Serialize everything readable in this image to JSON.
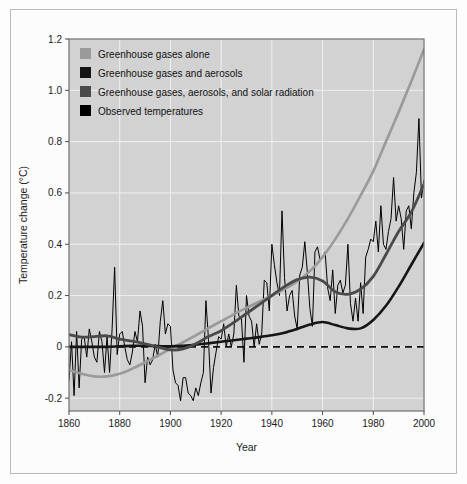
{
  "chart_data": {
    "type": "line",
    "title": "",
    "xlabel": "Year",
    "ylabel": "Temperature change (°C)",
    "xlim": [
      1860,
      2000
    ],
    "ylim": [
      -0.25,
      1.2
    ],
    "xticks": [
      1860,
      1880,
      1900,
      1920,
      1940,
      1960,
      1980,
      2000
    ],
    "xtick_labels": [
      "1860",
      "1880",
      "1900",
      "1920",
      "1940",
      "1960",
      "1980",
      "2000"
    ],
    "yticks": [
      -0.2,
      0,
      0.2,
      0.4,
      0.6,
      0.8,
      1.0,
      1.2
    ],
    "ytick_labels": [
      "-0.2",
      "0",
      "0.2",
      "0.4",
      "0.6",
      "0.8",
      "1.0",
      "1.2"
    ],
    "grid": true,
    "grid_color": "#f0f0f0",
    "plot_background": "#d2d2d2",
    "zero_reference_line": {
      "value": 0,
      "style": "dashed",
      "color": "#111111"
    },
    "legend_position": "top-left",
    "legend": [
      {
        "label": "Greenhouse gases alone",
        "color": "#9a9a9a"
      },
      {
        "label": "Greenhouse gases and aerosols",
        "color": "#151515"
      },
      {
        "label": "Greenhouse gases, aerosols, and solar radiation",
        "color": "#4a4a4a"
      },
      {
        "label": "Observed temperatures",
        "color": "#000000"
      }
    ],
    "series": [
      {
        "name": "Greenhouse gases alone",
        "color": "#9a9a9a",
        "width": 2.6,
        "x": [
          1860,
          1865,
          1870,
          1875,
          1880,
          1885,
          1890,
          1895,
          1900,
          1905,
          1910,
          1915,
          1920,
          1925,
          1930,
          1935,
          1940,
          1945,
          1950,
          1955,
          1960,
          1965,
          1970,
          1975,
          1980,
          1985,
          1990,
          1995,
          2000
        ],
        "values": [
          -0.09,
          -0.105,
          -0.115,
          -0.115,
          -0.105,
          -0.085,
          -0.06,
          -0.035,
          -0.008,
          0.018,
          0.045,
          0.073,
          0.1,
          0.127,
          0.152,
          0.176,
          0.2,
          0.225,
          0.255,
          0.295,
          0.35,
          0.42,
          0.5,
          0.59,
          0.685,
          0.8,
          0.915,
          1.035,
          1.16
        ]
      },
      {
        "name": "Greenhouse gases and aerosols",
        "color": "#151515",
        "width": 2.6,
        "x": [
          1860,
          1865,
          1870,
          1875,
          1880,
          1885,
          1890,
          1895,
          1900,
          1905,
          1910,
          1915,
          1920,
          1925,
          1930,
          1935,
          1940,
          1945,
          1950,
          1955,
          1960,
          1965,
          1970,
          1975,
          1980,
          1985,
          1990,
          1995,
          2000
        ],
        "values": [
          0.0,
          0.0,
          0.0,
          0.0,
          0.002,
          0.004,
          0.004,
          0.003,
          0.002,
          0.004,
          0.008,
          0.014,
          0.02,
          0.026,
          0.032,
          0.038,
          0.045,
          0.055,
          0.07,
          0.087,
          0.097,
          0.085,
          0.072,
          0.072,
          0.105,
          0.16,
          0.235,
          0.32,
          0.405
        ]
      },
      {
        "name": "Greenhouse gases, aerosols, and solar radiation",
        "color": "#4a4a4a",
        "width": 2.8,
        "x": [
          1860,
          1865,
          1870,
          1875,
          1880,
          1885,
          1890,
          1895,
          1900,
          1905,
          1910,
          1915,
          1920,
          1925,
          1930,
          1935,
          1940,
          1945,
          1950,
          1955,
          1960,
          1965,
          1970,
          1975,
          1980,
          1985,
          1990,
          1995,
          2000
        ],
        "values": [
          0.048,
          0.038,
          0.04,
          0.043,
          0.03,
          0.022,
          0.012,
          0.0,
          -0.012,
          -0.008,
          0.012,
          0.04,
          0.063,
          0.095,
          0.13,
          0.165,
          0.2,
          0.235,
          0.262,
          0.272,
          0.257,
          0.215,
          0.205,
          0.225,
          0.275,
          0.36,
          0.45,
          0.525,
          0.635
        ]
      },
      {
        "name": "Observed temperatures",
        "color": "#000000",
        "width": 1.0,
        "x": [
          1860,
          1861,
          1862,
          1863,
          1864,
          1865,
          1866,
          1867,
          1868,
          1869,
          1870,
          1871,
          1872,
          1873,
          1874,
          1875,
          1876,
          1877,
          1878,
          1879,
          1880,
          1881,
          1882,
          1883,
          1884,
          1885,
          1886,
          1887,
          1888,
          1889,
          1890,
          1891,
          1892,
          1893,
          1894,
          1895,
          1896,
          1897,
          1898,
          1899,
          1900,
          1901,
          1902,
          1903,
          1904,
          1905,
          1906,
          1907,
          1908,
          1909,
          1910,
          1911,
          1912,
          1913,
          1914,
          1915,
          1916,
          1917,
          1918,
          1919,
          1920,
          1921,
          1922,
          1923,
          1924,
          1925,
          1926,
          1927,
          1928,
          1929,
          1930,
          1931,
          1932,
          1933,
          1934,
          1935,
          1936,
          1937,
          1938,
          1939,
          1940,
          1941,
          1942,
          1943,
          1944,
          1945,
          1946,
          1947,
          1948,
          1949,
          1950,
          1951,
          1952,
          1953,
          1954,
          1955,
          1956,
          1957,
          1958,
          1959,
          1960,
          1961,
          1962,
          1963,
          1964,
          1965,
          1966,
          1967,
          1968,
          1969,
          1970,
          1971,
          1972,
          1973,
          1974,
          1975,
          1976,
          1977,
          1978,
          1979,
          1980,
          1981,
          1982,
          1983,
          1984,
          1985,
          1986,
          1987,
          1988,
          1989,
          1990,
          1991,
          1992,
          1993,
          1994,
          1995,
          1996,
          1997,
          1998,
          1999,
          2000
        ],
        "values": [
          -0.13,
          0.02,
          -0.19,
          0.06,
          -0.16,
          0.03,
          0.04,
          -0.04,
          0.07,
          0.02,
          -0.04,
          -0.06,
          0.06,
          0.02,
          -0.1,
          0.04,
          -0.1,
          0.07,
          0.31,
          -0.03,
          0.05,
          0.06,
          0.0,
          -0.05,
          -0.07,
          -0.02,
          0.06,
          0.02,
          0.14,
          0.08,
          -0.14,
          -0.04,
          -0.07,
          -0.05,
          0.01,
          -0.04,
          0.1,
          0.18,
          0.05,
          0.09,
          0.08,
          -0.09,
          -0.14,
          -0.15,
          -0.21,
          -0.12,
          -0.12,
          -0.18,
          -0.19,
          -0.21,
          -0.16,
          -0.19,
          -0.14,
          -0.1,
          0.18,
          0.03,
          -0.18,
          -0.08,
          -0.02,
          0.04,
          0.03,
          0.09,
          0.0,
          0.05,
          0.0,
          0.05,
          0.24,
          0.12,
          0.11,
          -0.06,
          0.2,
          0.12,
          0.1,
          0.0,
          0.09,
          0.01,
          0.05,
          0.26,
          0.25,
          0.14,
          0.4,
          0.32,
          0.25,
          0.2,
          0.53,
          0.27,
          0.14,
          0.2,
          0.22,
          0.12,
          0.07,
          0.28,
          0.31,
          0.41,
          0.29,
          0.15,
          0.08,
          0.37,
          0.39,
          0.34,
          0.35,
          0.37,
          0.23,
          0.18,
          0.3,
          0.13,
          0.24,
          0.26,
          0.21,
          0.24,
          0.4,
          0.17,
          0.1,
          0.19,
          0.1,
          0.25,
          0.13,
          0.35,
          0.38,
          0.42,
          0.41,
          0.49,
          0.37,
          0.55,
          0.4,
          0.38,
          0.45,
          0.5,
          0.66,
          0.49,
          0.55,
          0.5,
          0.38,
          0.53,
          0.55,
          0.46,
          0.6,
          0.68,
          0.89,
          0.58,
          0.65
        ]
      }
    ]
  }
}
